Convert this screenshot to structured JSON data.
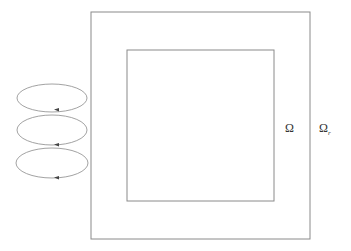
{
  "diagram": {
    "outer_domain": {
      "label": "Ω",
      "subscript": "r"
    },
    "inner_domain": {
      "label": "Ω"
    },
    "loops": {
      "count": 3,
      "direction": "arrow pointing left on bottom edge"
    },
    "colors": {
      "stroke": "#8a8a8a",
      "text": "#333333",
      "background": "#ffffff"
    }
  }
}
